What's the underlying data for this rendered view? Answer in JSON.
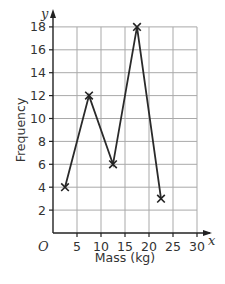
{
  "chart_data": {
    "type": "line",
    "subtype": "frequency-polygon",
    "title": "",
    "xlabel": "Mass (kg)",
    "ylabel": "Frequency",
    "x_axis_symbol": "x",
    "y_axis_symbol": "y",
    "origin_label": "O",
    "xlim": [
      0,
      30
    ],
    "ylim": [
      0,
      18
    ],
    "x_ticks": [
      5,
      10,
      15,
      20,
      25,
      30
    ],
    "y_ticks": [
      2,
      4,
      6,
      8,
      10,
      12,
      14,
      16,
      18
    ],
    "grid": true,
    "marker": "x",
    "series": [
      {
        "name": "Frequency",
        "x": [
          2.5,
          7.5,
          12.5,
          17.5,
          22.5
        ],
        "values": [
          4,
          12,
          6,
          18,
          3
        ]
      }
    ]
  }
}
